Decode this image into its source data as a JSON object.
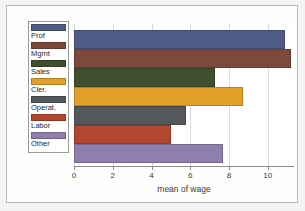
{
  "chart_data": {
    "type": "bar",
    "orientation": "horizontal",
    "title": "",
    "xlabel": "mean of wage",
    "ylabel": "",
    "categories": [
      "Prof",
      "Mgmt",
      "Sales",
      "Cler.",
      "Operat.",
      "Labor",
      "Other"
    ],
    "values": [
      10.9,
      11.2,
      7.3,
      8.7,
      5.8,
      5.0,
      7.7
    ],
    "colors": [
      "#4f5d86",
      "#7b4a3c",
      "#414f2e",
      "#e2a02a",
      "#54585a",
      "#b2462e",
      "#8f7fae"
    ],
    "xlim": [
      0,
      11.3
    ],
    "xticks": [
      0,
      2,
      4,
      6,
      8,
      10
    ],
    "xticklabels": [
      "0",
      "2",
      "4",
      "6",
      "8",
      "10"
    ],
    "grid": true,
    "grid_axis": "x",
    "legend_position": "left-inside",
    "legend_entries": [
      {
        "label": "Prof",
        "color": "#4f5d86"
      },
      {
        "label": "Mgmt",
        "color": "#7b4a3c"
      },
      {
        "label": "Sales",
        "color": "#414f2e"
      },
      {
        "label": "Cler.",
        "color": "#e2a02a"
      },
      {
        "label": "Operat.",
        "color": "#54585a"
      },
      {
        "label": "Labor",
        "color": "#b2462e"
      },
      {
        "label": "Other",
        "color": "#8f7fae"
      }
    ]
  },
  "figure": {
    "background": "#f4f4f2",
    "plot_background": "#ffffff",
    "frame_color": "#b9b9b7"
  }
}
